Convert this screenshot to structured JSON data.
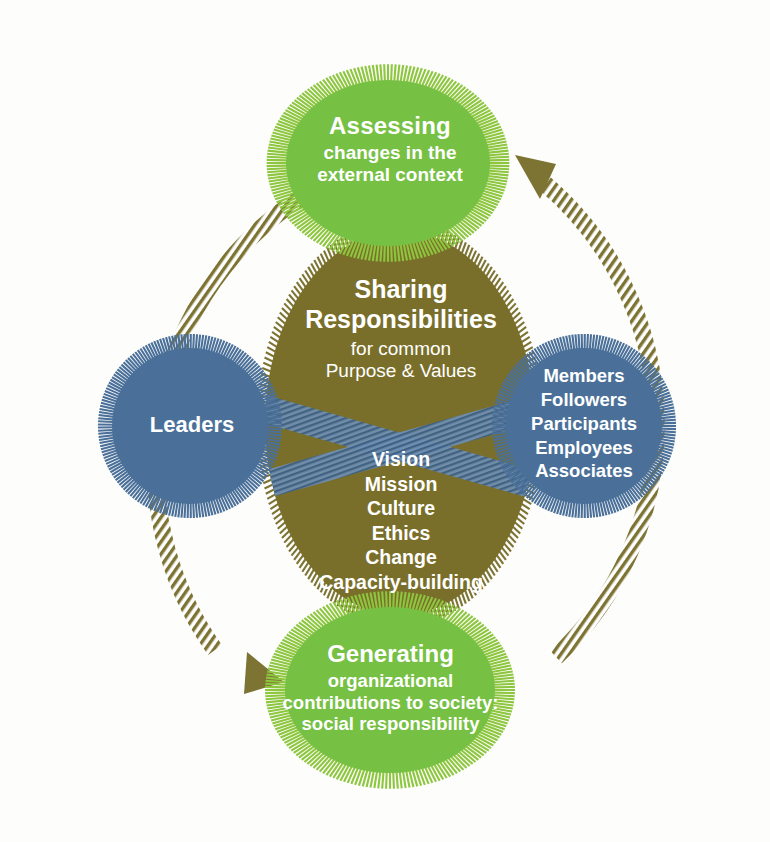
{
  "diagram": {
    "colors": {
      "green": "#76c043",
      "green_halo": "#8dc63f",
      "olive": "#7a6f2a",
      "olive_ring": "#7d7333",
      "blue": "#4a7099",
      "blue_halo": "#4a7099",
      "background": "#fdfdfb",
      "text": "#ffffff"
    },
    "center": {
      "heading_line_1": "Sharing",
      "heading_line_2": "Responsibilities",
      "heading_line_3": "for common",
      "heading_line_4": "Purpose & Values",
      "keywords": [
        "Vision",
        "Mission",
        "Culture",
        "Ethics",
        "Change",
        "Capacity-building"
      ]
    },
    "top_node": {
      "title": "Assessing",
      "sub_line_1": "changes in the",
      "sub_line_2": "external context"
    },
    "bottom_node": {
      "title": "Generating",
      "sub_line_1": "organizational",
      "sub_line_2": "contributions to society:",
      "sub_line_3": "social responsibility"
    },
    "left_node": {
      "title": "Leaders"
    },
    "right_node": {
      "items": [
        "Members",
        "Followers",
        "Participants",
        "Employees",
        "Associates"
      ]
    },
    "arrows": {
      "left_arc_label": "cycle-arrow-down-left",
      "right_arc_label": "cycle-arrow-up-right"
    }
  }
}
